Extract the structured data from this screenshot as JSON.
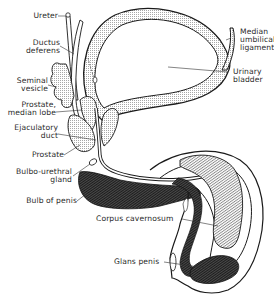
{
  "diagram": {
    "colors": {
      "ink": "#1a1a1a",
      "stipple": "#bdbdbd",
      "dark_tissue": "#2b2b2b",
      "hatch": "#9a9a9a",
      "background": "#ffffff"
    },
    "labels": [
      {
        "id": "ureter",
        "text": "Ureter"
      },
      {
        "id": "ductus-deferens",
        "text": "Ductus\ndeferens"
      },
      {
        "id": "seminal-vesicle",
        "text": "Seminal\nvesicle"
      },
      {
        "id": "prostate-median-lobe",
        "text": "Prostate,\nmedian lobe"
      },
      {
        "id": "ejaculatory-duct",
        "text": "Ejaculatory\nduct"
      },
      {
        "id": "prostate",
        "text": "Prostate"
      },
      {
        "id": "bulbo-urethral-gland",
        "text": "Bulbo-urethral\ngland"
      },
      {
        "id": "bulb-of-penis",
        "text": "Bulb of penis"
      },
      {
        "id": "corpus-cavernosum",
        "text": "Corpus cavernosum"
      },
      {
        "id": "glans-penis",
        "text": "Glans penis"
      },
      {
        "id": "median-umbilical-ligament",
        "text": "Median\numbilical\nligament"
      },
      {
        "id": "urinary-bladder",
        "text": "Urinary\nbladder"
      }
    ]
  }
}
